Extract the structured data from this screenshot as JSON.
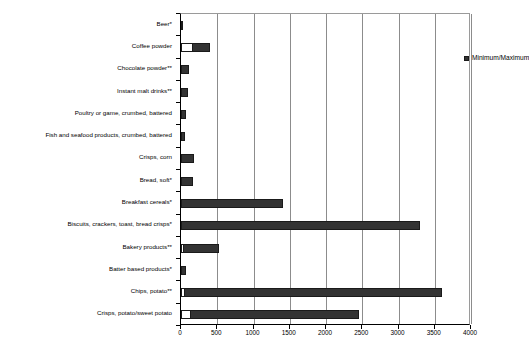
{
  "chart_data": {
    "type": "bar",
    "orientation": "horizontal",
    "title": "",
    "subtitle": "",
    "xlabel": "",
    "ylabel": "",
    "xlim": [
      0,
      4000
    ],
    "xticks": [
      0,
      500,
      1000,
      1500,
      2000,
      2500,
      3000,
      3500,
      4000
    ],
    "xtick_labels": [
      "0",
      "500",
      "1000",
      "1500",
      "2000",
      "2500",
      "3000",
      "3500",
      "4000"
    ],
    "grid": "vertical",
    "legend": {
      "position": "top-center-inside",
      "entries": [
        {
          "label": "Minimum/Maximum",
          "color": "#333333"
        }
      ]
    },
    "categories": [
      "Beer*",
      "Coffee powder",
      "Chocolate powder**",
      "Instant malt drinks**",
      "Poultry or game, crumbed, battered",
      "Fish and seafood products, crumbed, battered",
      "Crisps, corn",
      "Bread, soft*",
      "Breakfast cereals*",
      "Biscuits, crackers, toast, bread crisps*",
      "Bakery products**",
      "Batter based products*",
      "Chips, potato**",
      "Crisps, potato/sweet potato"
    ],
    "series": [
      {
        "name": "Minimum",
        "color": "#ffffff",
        "values": [
          0,
          150,
          0,
          0,
          0,
          0,
          0,
          0,
          0,
          0,
          30,
          0,
          40,
          120
        ]
      },
      {
        "name": "Maximum",
        "color": "#333333",
        "values": [
          30,
          400,
          110,
          90,
          70,
          50,
          180,
          170,
          1400,
          3300,
          520,
          70,
          3600,
          2450
        ]
      }
    ]
  },
  "colors": {
    "bar_max": "#333333",
    "bar_min": "#ffffff",
    "bar_border": "#1a1a1a",
    "gridline": "#8c8c8c",
    "axis": "#000000",
    "background": "#ffffff"
  }
}
